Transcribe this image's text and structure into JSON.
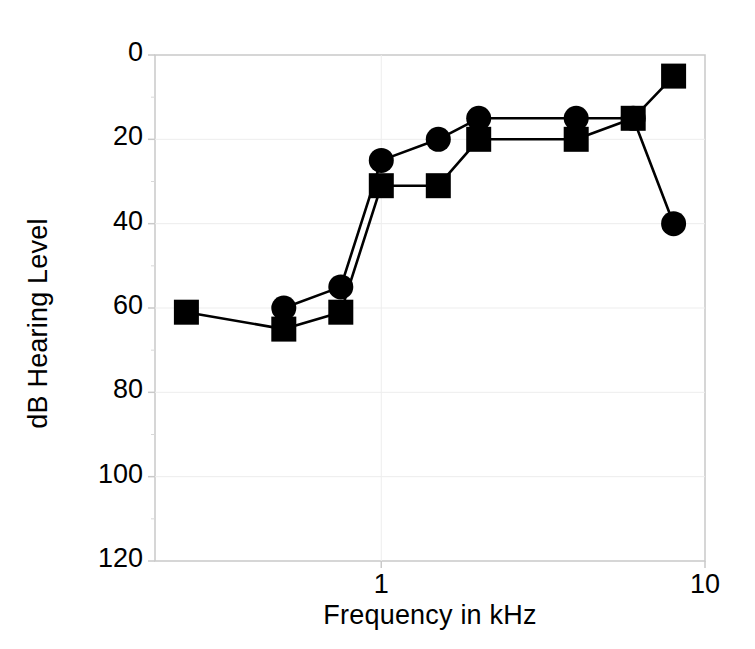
{
  "chart_data": {
    "type": "line",
    "title": "",
    "xlabel": "Frequency in kHz",
    "ylabel": "dB Hearing Level",
    "xscale": "log",
    "xlim": [
      0.2,
      10
    ],
    "ylim": [
      0,
      120
    ],
    "y_inverted": true,
    "grid": false,
    "legend": "none",
    "xticks": [
      {
        "value": 1,
        "label": "1"
      },
      {
        "value": 10,
        "label": "10"
      }
    ],
    "yticks": [
      {
        "value": 0,
        "label": "0"
      },
      {
        "value": 20,
        "label": "20"
      },
      {
        "value": 40,
        "label": "40"
      },
      {
        "value": 60,
        "label": "60"
      },
      {
        "value": 80,
        "label": "80"
      },
      {
        "value": 100,
        "label": "100"
      },
      {
        "value": 120,
        "label": "120"
      }
    ],
    "yminor": [
      10,
      30,
      50,
      70,
      90,
      110
    ],
    "series": [
      {
        "name": "circle-series",
        "marker": "circle",
        "color": "#000000",
        "points": [
          {
            "x": 0.5,
            "y": 60
          },
          {
            "x": 0.75,
            "y": 55
          },
          {
            "x": 1.0,
            "y": 25
          },
          {
            "x": 1.5,
            "y": 20
          },
          {
            "x": 2.0,
            "y": 15
          },
          {
            "x": 4.0,
            "y": 15
          },
          {
            "x": 6.0,
            "y": 15
          },
          {
            "x": 8.0,
            "y": 40
          }
        ]
      },
      {
        "name": "square-series",
        "marker": "square",
        "color": "#000000",
        "points": [
          {
            "x": 0.25,
            "y": 61
          },
          {
            "x": 0.5,
            "y": 65
          },
          {
            "x": 0.75,
            "y": 61
          },
          {
            "x": 1.0,
            "y": 31
          },
          {
            "x": 1.5,
            "y": 31
          },
          {
            "x": 2.0,
            "y": 20
          },
          {
            "x": 4.0,
            "y": 20
          },
          {
            "x": 6.0,
            "y": 15
          },
          {
            "x": 8.0,
            "y": 5
          }
        ]
      }
    ]
  },
  "axis_titles": {
    "x": "Frequency in kHz",
    "y": "dB Hearing Level"
  }
}
